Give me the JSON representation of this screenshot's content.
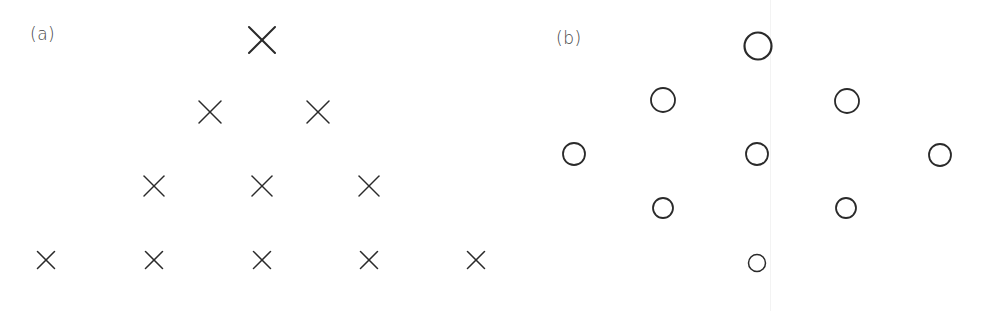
{
  "figure": {
    "panels": [
      {
        "label": "(a)",
        "marker": "cross-icon",
        "label_pos": {
          "x": 30,
          "y": 24
        },
        "color": "#2a2a2a",
        "points": [
          {
            "x": 262,
            "y": 40,
            "size": 26,
            "row": 1
          },
          {
            "x": 210,
            "y": 112,
            "size": 22,
            "row": 2
          },
          {
            "x": 318,
            "y": 112,
            "size": 22,
            "row": 2
          },
          {
            "x": 154,
            "y": 186,
            "size": 20,
            "row": 3
          },
          {
            "x": 262,
            "y": 186,
            "size": 20,
            "row": 3
          },
          {
            "x": 369,
            "y": 186,
            "size": 20,
            "row": 3
          },
          {
            "x": 46,
            "y": 260,
            "size": 17,
            "row": 4
          },
          {
            "x": 154,
            "y": 260,
            "size": 17,
            "row": 4
          },
          {
            "x": 262,
            "y": 260,
            "size": 17,
            "row": 4
          },
          {
            "x": 369,
            "y": 260,
            "size": 17,
            "row": 4
          },
          {
            "x": 476,
            "y": 260,
            "size": 17,
            "row": 4
          }
        ]
      },
      {
        "label": "(b)",
        "marker": "circle-icon",
        "label_pos": {
          "x": 556,
          "y": 28
        },
        "color": "#2a2a2a",
        "points": [
          {
            "x": 758,
            "y": 46,
            "r": 13.5,
            "row": 1
          },
          {
            "x": 663,
            "y": 100,
            "r": 12,
            "row": 2
          },
          {
            "x": 847,
            "y": 101,
            "r": 12,
            "row": 2
          },
          {
            "x": 574,
            "y": 154,
            "r": 11,
            "row": 3
          },
          {
            "x": 757,
            "y": 154,
            "r": 11,
            "row": 3
          },
          {
            "x": 940,
            "y": 155,
            "r": 11,
            "row": 3
          },
          {
            "x": 663,
            "y": 208,
            "r": 10,
            "row": 4
          },
          {
            "x": 846,
            "y": 208,
            "r": 10,
            "row": 4
          },
          {
            "x": 757,
            "y": 263,
            "r": 8.5,
            "row": 5
          }
        ]
      }
    ],
    "baseline": {
      "x1": 28,
      "x2": 760,
      "y": 309,
      "color": "#111111"
    }
  }
}
